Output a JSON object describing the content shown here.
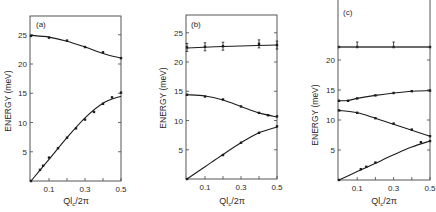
{
  "chart_data": [
    {
      "panel_label": "(a)",
      "type": "line",
      "title": "",
      "xlabel": "Ql_c/2π",
      "ylabel": "ENERGY (meV)",
      "xlim": [
        0,
        0.5
      ],
      "ylim": [
        0,
        28
      ],
      "xticks": [
        0.1,
        0.3,
        0.5
      ],
      "yticks": [
        5,
        10,
        15,
        20,
        25
      ],
      "grid": false,
      "series": [
        {
          "name": "upper branch",
          "x": [
            0,
            0.1,
            0.2,
            0.3,
            0.4,
            0.5
          ],
          "values": [
            24.8,
            24.5,
            24.0,
            22.9,
            22.0,
            21.0
          ],
          "curve": [
            [
              0,
              24.9
            ],
            [
              0.1,
              24.6
            ],
            [
              0.2,
              23.9
            ],
            [
              0.3,
              22.9
            ],
            [
              0.4,
              21.8
            ],
            [
              0.5,
              21.0
            ]
          ]
        },
        {
          "name": "lower branch",
          "x": [
            0,
            0.05,
            0.067,
            0.1,
            0.15,
            0.2,
            0.25,
            0.3,
            0.35,
            0.4,
            0.45,
            0.5
          ],
          "values": [
            0,
            1.9,
            2.6,
            4.0,
            5.6,
            7.4,
            9.0,
            10.5,
            11.8,
            13.2,
            14.3,
            15.1
          ],
          "curve": [
            [
              0,
              0
            ],
            [
              0.1,
              3.7
            ],
            [
              0.2,
              7.4
            ],
            [
              0.3,
              10.8
            ],
            [
              0.4,
              13.3
            ],
            [
              0.5,
              14.5
            ]
          ]
        }
      ]
    },
    {
      "panel_label": "(b)",
      "type": "line",
      "title": "",
      "xlabel": "Ql_c/2π",
      "ylabel": "ENERGY (meV)",
      "xlim": [
        0,
        0.5
      ],
      "ylim": [
        0,
        28
      ],
      "xticks": [
        0.1,
        0.3,
        0.5
      ],
      "yticks": [
        5,
        10,
        15,
        20,
        25
      ],
      "grid": false,
      "series": [
        {
          "name": "top branch (with error bars)",
          "x": [
            0,
            0.1,
            0.2,
            0.4,
            0.5
          ],
          "values": [
            22.5,
            22.6,
            22.7,
            23.1,
            22.9
          ],
          "error_bars": true,
          "curve": [
            [
              0,
              22.4
            ],
            [
              0.25,
              22.7
            ],
            [
              0.5,
              22.9
            ]
          ]
        },
        {
          "name": "middle branch",
          "x": [
            0,
            0.1,
            0.2,
            0.3,
            0.4,
            0.45,
            0.5
          ],
          "values": [
            14.4,
            14.1,
            13.6,
            12.4,
            11.3,
            10.9,
            10.7
          ],
          "curve": [
            [
              0,
              14.4
            ],
            [
              0.1,
              14.2
            ],
            [
              0.2,
              13.5
            ],
            [
              0.3,
              12.4
            ],
            [
              0.4,
              11.3
            ],
            [
              0.5,
              10.6
            ]
          ]
        },
        {
          "name": "lower branch",
          "x": [
            0,
            0.2,
            0.3,
            0.4,
            0.5
          ],
          "values": [
            0,
            4.1,
            6.2,
            7.9,
            9.0
          ],
          "curve": [
            [
              0,
              0
            ],
            [
              0.1,
              2.1
            ],
            [
              0.2,
              4.2
            ],
            [
              0.3,
              6.2
            ],
            [
              0.4,
              7.9
            ],
            [
              0.5,
              8.9
            ]
          ]
        }
      ]
    },
    {
      "panel_label": "(c)",
      "type": "line",
      "title": "",
      "xlabel": "Ql_c/2π",
      "ylabel": "ENERGY (meV)",
      "xlim": [
        0,
        0.5
      ],
      "ylim": [
        0,
        21
      ],
      "xticks": [
        0.1,
        0.3,
        0.5
      ],
      "yticks": [
        5,
        10,
        15,
        20
      ],
      "grid": false,
      "axis_break": true,
      "series": [
        {
          "name": "top branch (broken axis, with error bars)",
          "x": [
            0,
            0.1,
            0.3,
            0.5
          ],
          "values": [
            22,
            22,
            22,
            22
          ],
          "error_bars": true
        },
        {
          "name": "upper branch",
          "x": [
            0,
            0.05,
            0.1,
            0.2,
            0.3,
            0.4,
            0.5
          ],
          "values": [
            13.2,
            13.2,
            13.6,
            14.1,
            14.5,
            14.8,
            14.9
          ],
          "curve": [
            [
              0,
              13.2
            ],
            [
              0.05,
              13.25
            ],
            [
              0.1,
              13.6
            ],
            [
              0.2,
              14.1
            ],
            [
              0.3,
              14.5
            ],
            [
              0.4,
              14.8
            ],
            [
              0.5,
              14.9
            ]
          ]
        },
        {
          "name": "middle branch",
          "x": [
            0,
            0.1,
            0.2,
            0.3,
            0.4,
            0.5
          ],
          "values": [
            11.6,
            11.2,
            10.3,
            9.4,
            8.4,
            7.3
          ],
          "curve": [
            [
              0,
              11.6
            ],
            [
              0.1,
              11.2
            ],
            [
              0.2,
              10.3
            ],
            [
              0.3,
              9.3
            ],
            [
              0.4,
              8.3
            ],
            [
              0.5,
              7.3
            ]
          ]
        },
        {
          "name": "lower branch",
          "x": [
            0,
            0.12,
            0.15,
            0.2,
            0.45,
            0.5
          ],
          "values": [
            0,
            1.8,
            2.2,
            2.9,
            6.3,
            6.5
          ],
          "curve": [
            [
              0,
              0
            ],
            [
              0.1,
              1.4
            ],
            [
              0.2,
              2.8
            ],
            [
              0.3,
              4.2
            ],
            [
              0.4,
              5.5
            ],
            [
              0.5,
              6.5
            ]
          ]
        }
      ]
    }
  ],
  "panels": [
    {
      "label": "(a)",
      "ylabel": "ENERGY  (meV)",
      "xlabel_main": "Ql",
      "xlabel_sub": "c",
      "xlabel_tail": "/2π",
      "xtick_labels": [
        "0.1",
        "0.3",
        "0.5"
      ],
      "ytick_labels": [
        "5",
        "10",
        "15",
        "20",
        "25"
      ]
    },
    {
      "label": "(b)",
      "ylabel": "ENERGY (meV)",
      "xlabel_main": "Ql",
      "xlabel_sub": "c",
      "xlabel_tail": "/2π",
      "xtick_labels": [
        "0.1",
        "0.3",
        "0.5"
      ],
      "ytick_labels": [
        "5",
        "10",
        "15",
        "20",
        "25"
      ]
    },
    {
      "label": "(c)",
      "ylabel": "ENERGY (meV)",
      "xlabel_main": "Ql",
      "xlabel_sub": "c",
      "xlabel_tail": "/2π",
      "xtick_labels": [
        "0.1",
        "0.3",
        "0.5"
      ],
      "ytick_labels": [
        "5",
        "10",
        "15",
        "20"
      ]
    }
  ]
}
